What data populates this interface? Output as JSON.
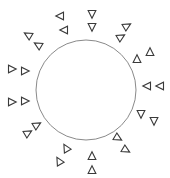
{
  "diagram": {
    "canvas": {
      "width": 170,
      "height": 178
    },
    "colors": {
      "background": "#ffffff",
      "circle_stroke": "#8a8a8a",
      "triangle_stroke": "#3a3a3a",
      "triangle_fill": "#ffffff"
    },
    "circle": {
      "cx": 86,
      "cy": 90,
      "r": 50
    },
    "triangle_size": 7,
    "pairs": [
      {
        "name": "top-left",
        "a": [
          60,
          16
        ],
        "b": [
          64,
          30
        ],
        "rotation": 180
      },
      {
        "name": "top",
        "a": [
          92,
          14
        ],
        "b": [
          92,
          27
        ],
        "rotation": 90
      },
      {
        "name": "upper-right",
        "a": [
          127,
          26
        ],
        "b": [
          121,
          37
        ],
        "rotation": -30
      },
      {
        "name": "right-upper",
        "a": [
          150,
          52
        ],
        "b": [
          137,
          59
        ],
        "rotation": -90
      },
      {
        "name": "right",
        "a": [
          147,
          86
        ],
        "b": [
          160,
          86
        ],
        "rotation": 180
      },
      {
        "name": "right-lower",
        "a": [
          141,
          114
        ],
        "b": [
          154,
          121
        ],
        "rotation": 90
      },
      {
        "name": "lower-right",
        "a": [
          118,
          138
        ],
        "b": [
          126,
          150
        ],
        "rotation": 30
      },
      {
        "name": "bottom",
        "a": [
          92,
          156
        ],
        "b": [
          92,
          170
        ],
        "rotation": -90
      },
      {
        "name": "lower-left",
        "a": [
          66,
          148
        ],
        "b": [
          59,
          161
        ],
        "rotation": -120
      },
      {
        "name": "left-lower",
        "a": [
          37,
          125
        ],
        "b": [
          28,
          133
        ],
        "rotation": -30
      },
      {
        "name": "left",
        "a": [
          12,
          102
        ],
        "b": [
          25,
          101
        ],
        "rotation": 0
      },
      {
        "name": "left-upper",
        "a": [
          12,
          69
        ],
        "b": [
          25,
          71
        ],
        "rotation": 0
      },
      {
        "name": "upper-left",
        "a": [
          28,
          35
        ],
        "b": [
          38,
          45
        ],
        "rotation": -150
      }
    ]
  }
}
